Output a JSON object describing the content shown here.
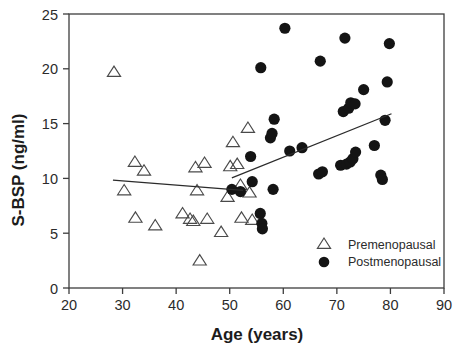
{
  "chart_data": {
    "type": "scatter",
    "title": "",
    "xlabel": "Age (years)",
    "ylabel": "S-BSP (ng/ml)",
    "xlim": [
      20,
      90
    ],
    "ylim": [
      0,
      25
    ],
    "xticks": [
      20,
      30,
      40,
      50,
      60,
      70,
      80,
      90
    ],
    "yticks": [
      0,
      5,
      10,
      15,
      20,
      25
    ],
    "xtick_labels": [
      "20",
      "30",
      "40",
      "50",
      "60",
      "70",
      "80",
      "90"
    ],
    "ytick_labels": [
      "0",
      "5",
      "10",
      "15",
      "20",
      "25"
    ],
    "grid": false,
    "legend_position": "lower-right",
    "series": [
      {
        "name": "Premenopausal",
        "marker": "open-triangle",
        "color": "#4a4a4a",
        "points": [
          [
            28.4,
            19.7
          ],
          [
            30.3,
            8.9
          ],
          [
            32.3,
            11.5
          ],
          [
            32.4,
            6.4
          ],
          [
            34.0,
            10.7
          ],
          [
            36.1,
            5.7
          ],
          [
            41.2,
            6.8
          ],
          [
            42.6,
            6.3
          ],
          [
            43.2,
            6.1
          ],
          [
            43.6,
            11.0
          ],
          [
            43.9,
            8.9
          ],
          [
            44.4,
            2.5
          ],
          [
            45.3,
            11.4
          ],
          [
            45.8,
            6.3
          ],
          [
            48.4,
            5.1
          ],
          [
            49.6,
            8.3
          ],
          [
            50.1,
            11.1
          ],
          [
            50.6,
            13.3
          ],
          [
            51.4,
            11.3
          ],
          [
            52.0,
            9.4
          ],
          [
            52.2,
            6.4
          ],
          [
            53.4,
            14.6
          ],
          [
            53.7,
            8.7
          ],
          [
            54.2,
            6.2
          ]
        ],
        "regression_line": {
          "x0": 28.2,
          "y0": 9.85,
          "x1": 52.5,
          "y1": 8.9
        }
      },
      {
        "name": "Postmenopausal",
        "marker": "filled-circle",
        "color": "#141414",
        "points": [
          [
            50.4,
            9.0
          ],
          [
            52.0,
            8.8
          ],
          [
            53.9,
            12.0
          ],
          [
            54.2,
            9.7
          ],
          [
            55.7,
            6.8
          ],
          [
            55.8,
            20.1
          ],
          [
            56.0,
            5.9
          ],
          [
            56.1,
            5.4
          ],
          [
            57.6,
            13.7
          ],
          [
            57.9,
            14.1
          ],
          [
            58.1,
            9.0
          ],
          [
            58.3,
            15.4
          ],
          [
            60.3,
            23.7
          ],
          [
            61.2,
            12.5
          ],
          [
            63.5,
            12.8
          ],
          [
            66.6,
            10.4
          ],
          [
            66.9,
            20.7
          ],
          [
            67.3,
            10.6
          ],
          [
            70.7,
            11.2
          ],
          [
            71.2,
            16.1
          ],
          [
            71.5,
            22.8
          ],
          [
            71.8,
            11.3
          ],
          [
            72.2,
            16.4
          ],
          [
            72.5,
            11.5
          ],
          [
            72.6,
            16.9
          ],
          [
            73.0,
            11.8
          ],
          [
            73.4,
            16.8
          ],
          [
            73.5,
            12.4
          ],
          [
            75.0,
            18.1
          ],
          [
            77.0,
            13.0
          ],
          [
            78.2,
            10.3
          ],
          [
            78.5,
            9.9
          ],
          [
            79.0,
            15.3
          ],
          [
            79.4,
            18.8
          ],
          [
            79.8,
            22.3
          ]
        ],
        "regression_line": {
          "x0": 50.4,
          "y0": 10.05,
          "x1": 80.2,
          "y1": 15.9
        }
      }
    ]
  },
  "legend": {
    "entries": [
      {
        "label": "Premenopausal",
        "marker": "open-triangle"
      },
      {
        "label": "Postmenopausal",
        "marker": "filled-circle"
      }
    ]
  },
  "axes": {
    "x_axis_title": "Age (years)",
    "y_axis_title": "S-BSP (ng/ml)"
  }
}
